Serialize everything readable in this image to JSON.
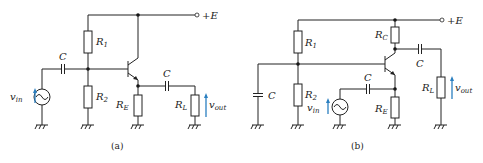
{
  "figure": {
    "panels": [
      {
        "id": "a",
        "caption": "(a)",
        "components": {
          "supply": "+E",
          "r1": {
            "main": "R",
            "sub": "1"
          },
          "r2": {
            "main": "R",
            "sub": "2"
          },
          "re": {
            "main": "R",
            "sub": "E"
          },
          "rl": {
            "main": "R",
            "sub": "L"
          },
          "c_in": "C",
          "c_out": "C",
          "vin": {
            "main": "v",
            "sub": "in"
          },
          "vout": {
            "main": "v",
            "sub": "out"
          }
        }
      },
      {
        "id": "b",
        "caption": "(b)",
        "components": {
          "supply": "+E",
          "r1": {
            "main": "R",
            "sub": "1"
          },
          "r2": {
            "main": "R",
            "sub": "2"
          },
          "rc": {
            "main": "R",
            "sub": "C"
          },
          "re": {
            "main": "R",
            "sub": "E"
          },
          "rl": {
            "main": "R",
            "sub": "L"
          },
          "c_base": "C",
          "c_in": "C",
          "c_out": "C",
          "vin": {
            "main": "v",
            "sub": "in"
          },
          "vout": {
            "main": "v",
            "sub": "out"
          }
        }
      }
    ],
    "colors": {
      "wire": "#222222",
      "arrow": "#2a7fc0",
      "background": "#ffffff"
    }
  }
}
